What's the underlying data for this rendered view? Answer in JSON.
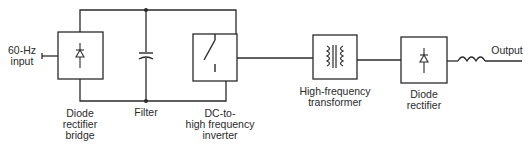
{
  "diagram": {
    "type": "block-diagram",
    "colors": {
      "line": "#2a2a2a",
      "background": "#ffffff"
    },
    "input": {
      "label_line1": "60-Hz",
      "label_line2": "input"
    },
    "output": {
      "label": "Output"
    },
    "blocks": [
      {
        "id": "diode-rectifier-bridge",
        "symbol": "diode",
        "label_lines": [
          "Diode",
          "rectifier",
          "bridge"
        ]
      },
      {
        "id": "filter",
        "symbol": "capacitor",
        "label_lines": [
          "Filter"
        ]
      },
      {
        "id": "inverter",
        "symbol": "switch",
        "label_lines": [
          "DC-to-",
          "high frequency",
          "inverter"
        ]
      },
      {
        "id": "transformer",
        "symbol": "transformer",
        "label_lines": [
          "High-frequency",
          "transformer"
        ]
      },
      {
        "id": "diode-rectifier",
        "symbol": "diode",
        "label_lines": [
          "Diode",
          "rectifier"
        ]
      },
      {
        "id": "output-inductor",
        "symbol": "inductor",
        "label_lines": []
      }
    ]
  }
}
